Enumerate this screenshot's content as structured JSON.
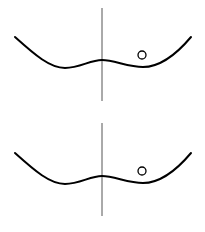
{
  "diagram": {
    "type": "double-well-potential",
    "background": "#ffffff",
    "stroke_color": "#000000",
    "axis_color": "#555555",
    "panels": [
      {
        "id": "top",
        "offset_y": 0,
        "axis": {
          "x": 102,
          "y1": 8,
          "y2": 101
        },
        "curve": "M15,37 C35,55 50,68 65,68 C80,68 90,60 102,60 C114,60 128,67 143,67 C160,67 175,56 191,37",
        "ball": {
          "cx": 142,
          "cy": 55,
          "r": 4
        }
      },
      {
        "id": "bottom",
        "offset_y": 116,
        "axis": {
          "x": 102,
          "y1": 7,
          "y2": 100
        },
        "curve": "M15,37 C35,55 50,68 65,68 C80,68 90,60 102,60 C114,60 128,67 143,67 C160,67 175,56 191,37",
        "ball": {
          "cx": 142,
          "cy": 55,
          "r": 4
        }
      }
    ]
  }
}
